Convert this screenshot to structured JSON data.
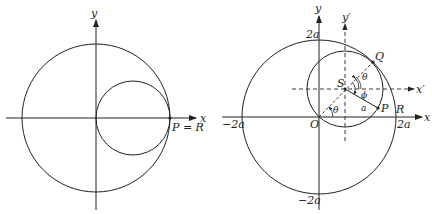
{
  "left_figure": {
    "labels": {
      "x": "x",
      "y": "y",
      "point": "P = R"
    }
  },
  "right_figure": {
    "labels": {
      "x": "x",
      "y": "y",
      "x_prime": "x′",
      "y_prime": "y′",
      "O": "O",
      "S": "S",
      "Q": "Q",
      "P": "P",
      "R": "R",
      "theta_origin": "θ",
      "theta_top": "θ",
      "phi": "ϕ",
      "radius": "a",
      "top_tick": "2a",
      "bottom_tick": "−2a",
      "left_tick": "−2a",
      "right_tick": "2a"
    }
  }
}
